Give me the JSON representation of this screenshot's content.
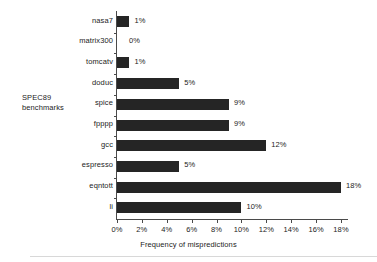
{
  "chart_data": {
    "type": "bar",
    "orientation": "horizontal",
    "title": "",
    "xlabel": "Frequency of mispredictions",
    "ylabel": "SPEC89 benchmarks",
    "categories": [
      "nasa7",
      "matrix300",
      "tomcatv",
      "doduc",
      "spice",
      "fpppp",
      "gcc",
      "espresso",
      "eqntott",
      "li"
    ],
    "values": [
      1,
      0,
      1,
      5,
      9,
      9,
      12,
      5,
      18,
      10
    ],
    "value_labels": [
      "1%",
      "0%",
      "1%",
      "5%",
      "9%",
      "9%",
      "12%",
      "5%",
      "18%",
      "10%"
    ],
    "xlim": [
      0,
      18
    ],
    "xticks": [
      0,
      2,
      4,
      6,
      8,
      10,
      12,
      14,
      16,
      18
    ],
    "xtick_labels": [
      "0%",
      "2%",
      "4%",
      "6%",
      "8%",
      "10%",
      "12%",
      "14%",
      "16%",
      "18%"
    ],
    "grid": false,
    "legend": null,
    "bar_color": "#252525",
    "background_color": "#ffffff",
    "text_color": "#1c1c1c",
    "axis_color": "#4a4a4a"
  },
  "axis_titles": {
    "y_line_1": "SPEC89",
    "y_line_2": "benchmarks",
    "x": "Frequency of mispredictions"
  }
}
